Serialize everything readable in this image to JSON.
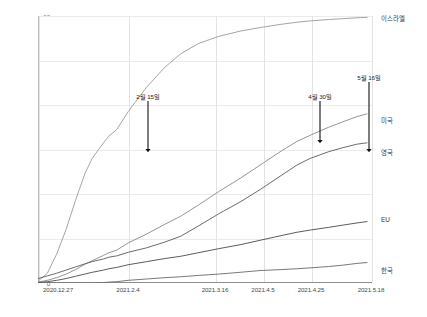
{
  "chart_data": {
    "type": "line",
    "title": "",
    "xlabel": "",
    "ylabel": "",
    "ylim": [
      0,
      60
    ],
    "yticks": [
      "0",
      "10",
      "20",
      "30",
      "40",
      "50",
      "60"
    ],
    "grid": true,
    "legend_position": "right-of-line-ends",
    "xticks": [
      "2020.12.27",
      "2021.2.4",
      "2021.3.16",
      "2021.4.5",
      "2021.4.25",
      "2021.5.18"
    ],
    "x": [
      "2020.12.27",
      "2021.1.3",
      "2021.1.10",
      "2021.1.17",
      "2021.1.24",
      "2021.1.31",
      "2021.2.4",
      "2021.2.11",
      "2021.2.15",
      "2021.2.18",
      "2021.2.25",
      "2021.3.4",
      "2021.3.11",
      "2021.3.16",
      "2021.3.22",
      "2021.3.29",
      "2021.4.5",
      "2021.4.12",
      "2021.4.19",
      "2021.4.25",
      "2021.4.30",
      "2021.5.6",
      "2021.5.11",
      "2021.5.16",
      "2021.5.18"
    ],
    "series": [
      {
        "name": "이스라엘",
        "color": "#9a9a9a",
        "values": [
          0.4,
          2.2,
          6.5,
          12.0,
          18.5,
          24.5,
          28.0,
          31.5,
          33.0,
          34.5,
          38.5,
          44.0,
          48.5,
          51.5,
          53.8,
          55.4,
          56.6,
          57.4,
          58.1,
          58.6,
          58.9,
          59.2,
          59.4,
          59.6,
          59.7
        ]
      },
      {
        "name": "미국",
        "color": "#8a8a8a",
        "values": [
          0.2,
          0.6,
          1.2,
          2.0,
          3.0,
          4.2,
          5.0,
          6.2,
          6.8,
          7.4,
          9.0,
          11.0,
          13.2,
          15.0,
          17.5,
          20.5,
          23.5,
          26.5,
          29.5,
          31.8,
          33.2,
          35.0,
          36.2,
          37.4,
          38.0
        ]
      },
      {
        "name": "영국",
        "color": "#5a5a5a",
        "values": [
          1.0,
          1.6,
          2.2,
          2.9,
          3.6,
          4.3,
          4.8,
          5.4,
          5.8,
          6.1,
          6.9,
          7.9,
          9.2,
          10.5,
          12.8,
          15.5,
          18.2,
          21.0,
          24.0,
          26.5,
          28.0,
          29.5,
          30.4,
          31.2,
          31.5
        ]
      },
      {
        "name": "EU",
        "color": "#4a4a4a",
        "values": [
          0.1,
          0.3,
          0.6,
          1.0,
          1.5,
          2.0,
          2.4,
          2.9,
          3.2,
          3.5,
          4.1,
          4.8,
          5.5,
          6.0,
          6.8,
          7.7,
          8.6,
          9.6,
          10.6,
          11.4,
          11.9,
          12.5,
          13.0,
          13.5,
          13.8
        ]
      },
      {
        "name": "한국",
        "color": "#6a6a6a",
        "values": [
          0.0,
          0.0,
          0.0,
          0.0,
          0.0,
          0.0,
          0.0,
          0.1,
          0.2,
          0.3,
          0.6,
          0.9,
          1.2,
          1.4,
          1.7,
          2.0,
          2.4,
          2.8,
          3.0,
          3.2,
          3.4,
          3.7,
          4.0,
          4.4,
          4.6
        ]
      }
    ],
    "annotations": [
      {
        "label": "2월 15일",
        "x": "2021.2.15",
        "target_value": 30.0
      },
      {
        "label": "4월 30일",
        "x": "2021.4.30",
        "target_value": 33.0
      },
      {
        "label": "5월 16일",
        "x": "2021.5.16",
        "target_value": 31.0
      }
    ]
  }
}
